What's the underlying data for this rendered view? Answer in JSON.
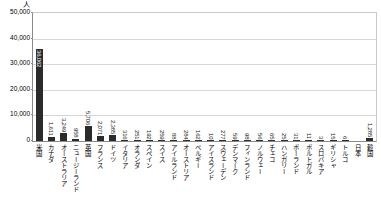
{
  "chart_data": {
    "type": "bar",
    "title": "",
    "subtitle": "",
    "unit_label": "人",
    "xlabel": "",
    "ylabel": "",
    "ylim": [
      0,
      50000
    ],
    "ytick_labels": [
      "50,000",
      "40,000",
      "30,000",
      "20,000",
      "10,000",
      "0"
    ],
    "ytick_values": [
      50000,
      40000,
      30000,
      20000,
      10000,
      0
    ],
    "grid": true,
    "legend": "none",
    "bar_color": "#2b2b2b",
    "categories": [
      "米国",
      "カナダ",
      "オーストラリア",
      "ニュージーランド",
      "英国",
      "フランス",
      "ドイツ",
      "イタリア",
      "オランダ",
      "スペイン",
      "スイス",
      "アイルランド",
      "オーストリア",
      "ベルギー",
      "アイスランド",
      "スウェーデン",
      "デンマーク",
      "フィンランド",
      "ノルウェー",
      "チェコ",
      "ハンガリー",
      "ポーランド",
      "ポルトガル",
      "スロバキア",
      "ギリシャ",
      "トルコ",
      "日本",
      "韓国"
    ],
    "values": [
      36062,
      1611,
      3249,
      958,
      5706,
      2071,
      2385,
      316,
      251,
      192,
      259,
      88,
      284,
      162,
      10,
      277,
      59,
      98,
      56,
      65,
      25,
      31,
      11,
      3,
      15,
      6,
      0,
      1285
    ],
    "value_labels": [
      "36,062",
      "1,611",
      "3,249",
      "958",
      "5,706",
      "2,071",
      "2,385",
      "316",
      "251",
      "192",
      "259",
      "88",
      "284",
      "162",
      "10",
      "277",
      "59",
      "98",
      "56",
      "65",
      "25",
      "31",
      "11",
      "3",
      "15",
      "6",
      "",
      "1,285"
    ]
  }
}
